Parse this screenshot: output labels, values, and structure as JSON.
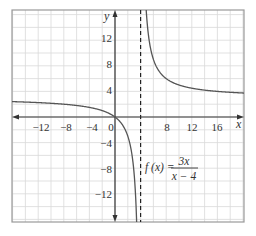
{
  "chart_data": {
    "type": "line",
    "title": "",
    "function_label": {
      "lhs": "f (x) =",
      "numerator": "3x",
      "denominator": "x − 4"
    },
    "xlabel": "x",
    "ylabel": "y",
    "xlim": [
      -16,
      20
    ],
    "ylim": [
      -16,
      16
    ],
    "grid": true,
    "grid_step": 2,
    "x_ticks": [
      -12,
      -8,
      -4,
      0,
      8,
      12,
      16
    ],
    "x_tick_labels": [
      "−12",
      "−8",
      "−4",
      "0",
      "8",
      "12",
      "16"
    ],
    "y_ticks": [
      12,
      8,
      4,
      -4,
      -8,
      -12
    ],
    "y_tick_labels": [
      "12",
      "8",
      "4",
      "−4",
      "−8",
      "−12"
    ],
    "vertical_asymptote": 4,
    "horizontal_asymptote": 3,
    "series": [
      {
        "name": "f(x) = 3x/(x − 4), left branch",
        "x": [
          -16,
          -12,
          -8,
          -4,
          -2,
          0,
          1,
          2,
          3,
          3.2
        ],
        "y": [
          2.4,
          2.25,
          2.0,
          1.5,
          1.0,
          0,
          -1.0,
          -3.0,
          -9.0,
          -12.0
        ]
      },
      {
        "name": "f(x) = 3x/(x − 4), right branch",
        "x": [
          4.75,
          5,
          6,
          8,
          12,
          16,
          20
        ],
        "y": [
          19.0,
          15.0,
          9.0,
          6.0,
          4.5,
          4.0,
          3.75
        ]
      }
    ],
    "colors": {
      "curve": "#555555",
      "axes": "#333333",
      "grid": "#d9d9d9",
      "frame": "#999999",
      "asymptote": "#222222"
    }
  },
  "labels": {
    "x_axis": "x",
    "y_axis": "y",
    "x_ticks": [
      "−12",
      "−8",
      "−4",
      "0",
      "8",
      "12",
      "16"
    ],
    "y_ticks": [
      "12",
      "8",
      "4",
      "−4",
      "−8",
      "−12"
    ],
    "formula_lhs": "f (x) =",
    "formula_num": "3x",
    "formula_den": "x − 4"
  }
}
